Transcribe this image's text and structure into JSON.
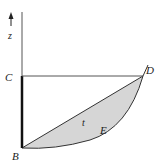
{
  "diagram": {
    "axis_label": "z",
    "points": {
      "B": "B",
      "C": "C",
      "D": "D",
      "E": "E"
    },
    "region_label": "t",
    "colors": {
      "line": "#333333",
      "fill": "#d6d6d6",
      "thick_segment": "#111111"
    }
  }
}
